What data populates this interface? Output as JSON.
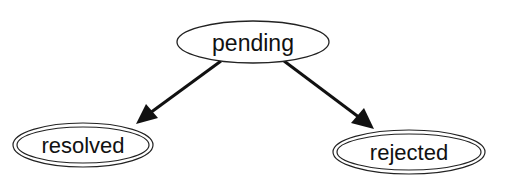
{
  "diagram": {
    "type": "state-diagram",
    "nodes": [
      {
        "id": "pending",
        "label": "pending",
        "shape": "ellipse",
        "border": "single"
      },
      {
        "id": "resolved",
        "label": "resolved",
        "shape": "ellipse",
        "border": "double"
      },
      {
        "id": "rejected",
        "label": "rejected",
        "shape": "ellipse",
        "border": "double"
      }
    ],
    "edges": [
      {
        "from": "pending",
        "to": "resolved"
      },
      {
        "from": "pending",
        "to": "rejected"
      }
    ],
    "colors": {
      "stroke": "#111111",
      "background": "#ffffff"
    }
  }
}
